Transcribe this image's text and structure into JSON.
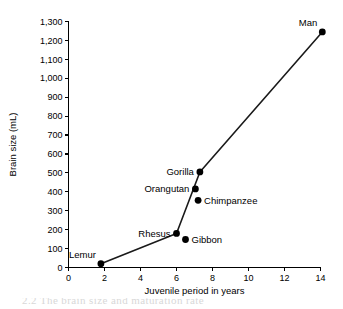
{
  "chart_data": {
    "type": "scatter",
    "title": "",
    "xlabel": "Juvenile period in years",
    "ylabel": "Brain size (mL)",
    "xlim": [
      0,
      14
    ],
    "ylim": [
      0,
      1300
    ],
    "grid": false,
    "legend": "none",
    "xticks": [
      "0",
      "2",
      "4",
      "6",
      "8",
      "10",
      "12",
      "14"
    ],
    "xtick_values": [
      0,
      2,
      4,
      6,
      8,
      10,
      12,
      14
    ],
    "yticks": [
      "0",
      "100",
      "200",
      "300",
      "400",
      "500",
      "600",
      "700",
      "800",
      "900",
      "1,000",
      "1,100",
      "1,200",
      "1,300"
    ],
    "ytick_values": [
      0,
      100,
      200,
      300,
      400,
      500,
      600,
      700,
      800,
      900,
      1000,
      1100,
      1200,
      1300
    ],
    "points": [
      {
        "label": "Lemur",
        "x": 1.8,
        "y": 20,
        "label_pos": "left-above"
      },
      {
        "label": "Rhesus",
        "x": 6.0,
        "y": 180,
        "label_pos": "left"
      },
      {
        "label": "Gibbon",
        "x": 6.5,
        "y": 148,
        "label_pos": "right"
      },
      {
        "label": "Chimpanzee",
        "x": 7.2,
        "y": 355,
        "label_pos": "right"
      },
      {
        "label": "Orangutan",
        "x": 7.05,
        "y": 415,
        "label_pos": "left"
      },
      {
        "label": "Gorilla",
        "x": 7.3,
        "y": 505,
        "label_pos": "left"
      },
      {
        "label": "Man",
        "x": 14.1,
        "y": 1245,
        "label_pos": "left-above"
      }
    ],
    "connected_path": [
      {
        "x": 1.8,
        "y": 20
      },
      {
        "x": 6.0,
        "y": 180
      },
      {
        "x": 7.3,
        "y": 505
      },
      {
        "x": 14.1,
        "y": 1245
      }
    ],
    "series": [
      {
        "name": "Brain size vs juvenile period",
        "x": [
          1.8,
          6.0,
          6.5,
          7.05,
          7.2,
          7.3,
          14.1
        ],
        "values": [
          20,
          180,
          148,
          415,
          355,
          505,
          1245
        ]
      }
    ],
    "colors": {
      "line": "#1a1a1a",
      "point": "#000000",
      "axis": "#000000",
      "background": "#ffffff"
    }
  },
  "caption": {
    "text": "2.2   The brain size and maturation rate"
  }
}
